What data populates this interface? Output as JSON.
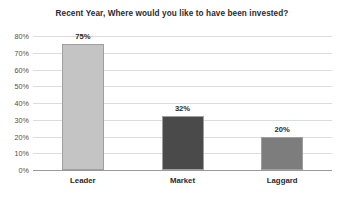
{
  "chart_data": {
    "type": "bar",
    "title": "Recent Year, Where would you like to have been invested?",
    "xlabel": "",
    "ylabel": "",
    "categories": [
      "Leader",
      "Market",
      "Laggard"
    ],
    "values": [
      75,
      32,
      20
    ],
    "value_labels": [
      "75%",
      "32%",
      "20%"
    ],
    "bar_colors": [
      "#c4c4c4",
      "#4a4a4a",
      "#7d7d7d"
    ],
    "bar_border_color": "#9f9f9f",
    "ylim": [
      0,
      80
    ],
    "ytick_values": [
      0,
      10,
      20,
      30,
      40,
      50,
      60,
      70,
      80
    ],
    "ytick_labels": [
      "0%",
      "10%",
      "20%",
      "30%",
      "40%",
      "50%",
      "60%",
      "70%",
      "80%"
    ],
    "grid": true,
    "gridline_color": "#dcdcdc",
    "axis_line_color": "#9a9a9a",
    "legend": "none",
    "background_color": "#ffffff",
    "text_color": "#2b2b2b"
  }
}
